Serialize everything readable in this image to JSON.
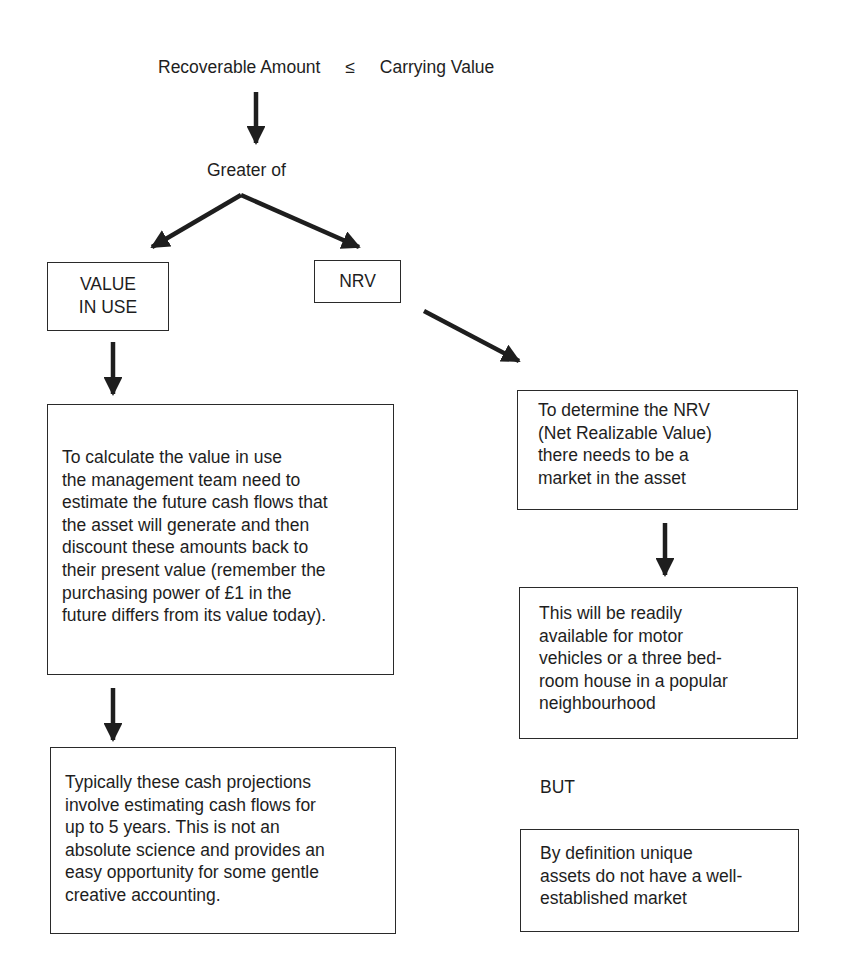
{
  "header": {
    "left_term": "Recoverable Amount",
    "operator": "≤",
    "right_term": "Carrying Value"
  },
  "greater_of_label": "Greater of",
  "branches": {
    "left": {
      "label": "VALUE\nIN USE"
    },
    "right": {
      "label": "NRV"
    }
  },
  "left_column": {
    "box1_text": "To calculate the value in use\nthe management team need to\nestimate the future cash flows that\nthe asset will generate and then\ndiscount these amounts back to\ntheir present value (remember the\npurchasing power of £1 in the\nfuture differs from its value today).",
    "box2_text": "Typically these cash projections\ninvolve estimating cash flows for\nup to 5 years. This is not an\nabsolute science and provides an\neasy opportunity for some gentle\ncreative accounting."
  },
  "right_column": {
    "box1_text": "To determine the NRV\n(Net Realizable Value)\nthere needs to be a\nmarket in the asset",
    "box2_text": "This will be readily\navailable for motor\nvehicles or a three bed-\nroom house in a popular\nneighbourhood",
    "but_label": "BUT",
    "box3_text": "By definition unique\nassets do not have a well-\nestablished market"
  },
  "icons": {
    "arrow_down": "arrow-down-icon",
    "arrow_diagonal_left": "arrow-down-left-icon",
    "arrow_diagonal_right": "arrow-down-right-icon"
  },
  "colors": {
    "ink": "#1e1e1e",
    "background": "#ffffff"
  }
}
